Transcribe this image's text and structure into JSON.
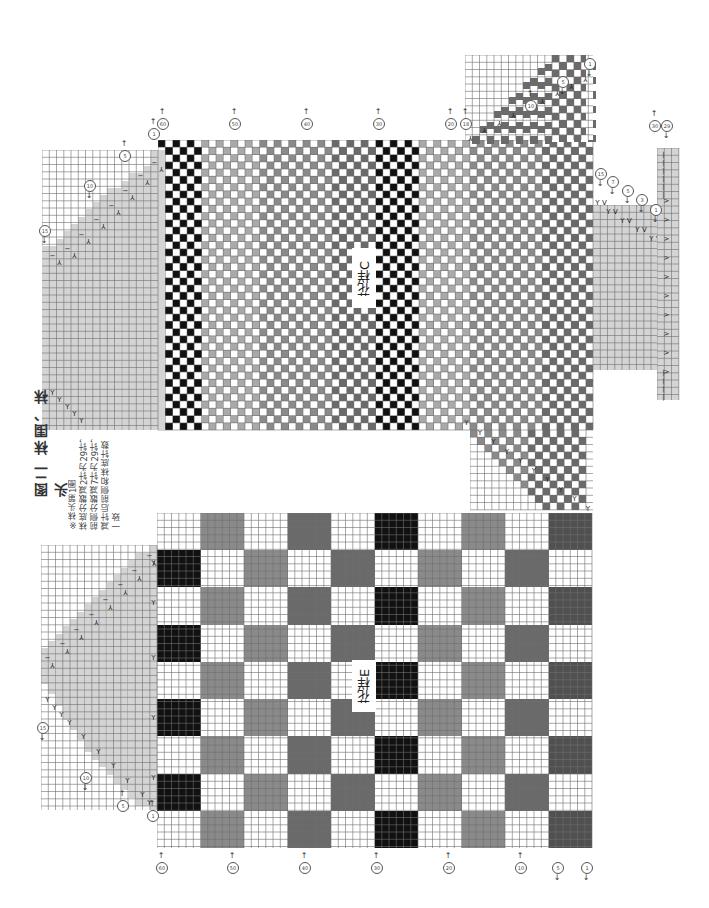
{
  "figure": {
    "title": "图二 袜围、袜头",
    "notes": [
      "※袜头第1圈",
      "袜底分散减2针为29针，",
      "前侧分散减7针为29针，",
      "减针后前侧和袜底针数",
      "一致"
    ]
  },
  "colors": {
    "white": "#ffffff",
    "black": "#111111",
    "light_grey": "#a9a9a9",
    "mid_grey": "#8a8a8a",
    "dark_grey": "#6a6a6a",
    "very_dark_grey": "#505050",
    "toe_grey": "#d4d4d4",
    "grid_line": "#777777"
  },
  "chart_c": {
    "label": "花样C",
    "bounds": {
      "x": 158,
      "y": 140,
      "w": 435,
      "h": 290
    },
    "cell": 7.25,
    "column_bands": [
      {
        "x0": 158,
        "x1": 203,
        "pattern": "checker",
        "color": "black"
      },
      {
        "x0": 203,
        "x1": 262,
        "pattern": "checker",
        "color": "light_grey"
      },
      {
        "x0": 262,
        "x1": 330,
        "pattern": "checker",
        "color": "mid_grey"
      },
      {
        "x0": 330,
        "x1": 375,
        "pattern": "checker",
        "color": "dark_grey"
      },
      {
        "x0": 375,
        "x1": 420,
        "pattern": "checker",
        "color": "black"
      },
      {
        "x0": 420,
        "x1": 470,
        "pattern": "checker",
        "color": "light_grey"
      },
      {
        "x0": 470,
        "x1": 545,
        "pattern": "checker",
        "color": "mid_grey"
      },
      {
        "x0": 545,
        "x1": 593,
        "pattern": "checker",
        "color": "dark_grey"
      }
    ],
    "top_markers": [
      {
        "x": 162,
        "num": "60",
        "dir": "up"
      },
      {
        "x": 234,
        "num": "50",
        "dir": "up"
      },
      {
        "x": 306,
        "num": "40",
        "dir": "up"
      },
      {
        "x": 378,
        "num": "30",
        "dir": "up"
      },
      {
        "x": 450,
        "num": "20",
        "dir": "up"
      },
      {
        "x": 465,
        "num": "18",
        "dir": "up"
      }
    ],
    "right_step_markers": [
      {
        "x": 530,
        "y": 112,
        "num": "10",
        "dir": "up"
      },
      {
        "x": 562,
        "y": 88,
        "num": "5",
        "dir": "down"
      },
      {
        "x": 589,
        "y": 70,
        "num": "1",
        "dir": "down"
      }
    ],
    "toe_markers": [
      {
        "x": 153,
        "y": 128,
        "num": "1",
        "dir": "up"
      },
      {
        "x": 124,
        "y": 150,
        "num": "5",
        "dir": "up"
      },
      {
        "x": 89,
        "y": 180,
        "num": "10",
        "dir": "down"
      },
      {
        "x": 44,
        "y": 225,
        "num": "15",
        "dir": "down"
      }
    ],
    "heel_markers": [
      {
        "x": 600,
        "y": 180,
        "num": "15",
        "dir": "down"
      },
      {
        "x": 612,
        "y": 188,
        "num": "7",
        "dir": "down"
      },
      {
        "x": 627,
        "y": 197,
        "num": "5",
        "dir": "down"
      },
      {
        "x": 641,
        "y": 206,
        "num": "3",
        "dir": "down"
      },
      {
        "x": 655,
        "y": 216,
        "num": "1",
        "dir": "down"
      },
      {
        "x": 666,
        "y": 132,
        "num": "29",
        "dir": "down"
      },
      {
        "x": 654,
        "y": 132,
        "num": "30",
        "dir": "up"
      }
    ]
  },
  "chart_e": {
    "label": "花样E",
    "bounds": {
      "x": 157,
      "y": 513,
      "w": 435,
      "h": 335
    },
    "block_cols": 10,
    "block_rows": 9,
    "blocks": [
      [
        "white",
        "mid_grey",
        "white",
        "dark_grey",
        "white",
        "black",
        "white",
        "mid_grey",
        "white",
        "very_dark_grey"
      ],
      [
        "black",
        "white",
        "mid_grey",
        "white",
        "dark_grey",
        "white",
        "mid_grey",
        "white",
        "dark_grey",
        "white"
      ],
      [
        "white",
        "mid_grey",
        "white",
        "dark_grey",
        "white",
        "black",
        "white",
        "mid_grey",
        "white",
        "very_dark_grey"
      ],
      [
        "black",
        "white",
        "mid_grey",
        "white",
        "dark_grey",
        "white",
        "mid_grey",
        "white",
        "dark_grey",
        "white"
      ],
      [
        "white",
        "mid_grey",
        "white",
        "dark_grey",
        "white",
        "black",
        "white",
        "mid_grey",
        "white",
        "very_dark_grey"
      ],
      [
        "black",
        "white",
        "mid_grey",
        "white",
        "dark_grey",
        "white",
        "mid_grey",
        "white",
        "dark_grey",
        "white"
      ],
      [
        "white",
        "mid_grey",
        "white",
        "dark_grey",
        "white",
        "black",
        "white",
        "mid_grey",
        "white",
        "very_dark_grey"
      ],
      [
        "black",
        "white",
        "mid_grey",
        "white",
        "dark_grey",
        "white",
        "mid_grey",
        "white",
        "dark_grey",
        "white"
      ],
      [
        "white",
        "mid_grey",
        "white",
        "dark_grey",
        "white",
        "black",
        "white",
        "mid_grey",
        "white",
        "very_dark_grey"
      ]
    ],
    "bottom_markers": [
      {
        "x": 161,
        "num": "60",
        "dir": "up"
      },
      {
        "x": 232,
        "num": "50",
        "dir": "up"
      },
      {
        "x": 304,
        "num": "40",
        "dir": "up"
      },
      {
        "x": 376,
        "num": "30",
        "dir": "up"
      },
      {
        "x": 448,
        "num": "20",
        "dir": "up"
      },
      {
        "x": 520,
        "num": "10",
        "dir": "up"
      },
      {
        "x": 557,
        "num": "5",
        "dir": "down"
      },
      {
        "x": 586,
        "num": "1",
        "dir": "down"
      }
    ],
    "toe_markers": [
      {
        "x": 152,
        "y": 810,
        "num": "1",
        "dir": "up"
      },
      {
        "x": 122,
        "y": 800,
        "num": "5",
        "dir": "up"
      },
      {
        "x": 85,
        "y": 772,
        "num": "10",
        "dir": "down"
      },
      {
        "x": 42,
        "y": 722,
        "num": "15",
        "dir": "down"
      }
    ]
  },
  "symbols": {
    "k2tog_left": "⅄",
    "k2tog_right": "Y",
    "purl": "−",
    "knit": "|",
    "increase": "V"
  }
}
